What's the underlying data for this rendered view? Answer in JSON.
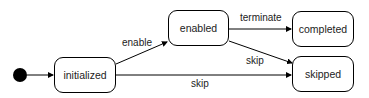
{
  "diagram": {
    "type": "state-machine",
    "states": [
      {
        "id": "initialized",
        "label": "initialized"
      },
      {
        "id": "enabled",
        "label": "enabled"
      },
      {
        "id": "completed",
        "label": "completed"
      },
      {
        "id": "skipped",
        "label": "skipped"
      }
    ],
    "transitions": [
      {
        "from": "initial",
        "to": "initialized",
        "label": ""
      },
      {
        "from": "initialized",
        "to": "enabled",
        "label": "enable"
      },
      {
        "from": "enabled",
        "to": "completed",
        "label": "terminate"
      },
      {
        "from": "enabled",
        "to": "skipped",
        "label": "skip"
      },
      {
        "from": "initialized",
        "to": "skipped",
        "label": "skip"
      }
    ]
  }
}
